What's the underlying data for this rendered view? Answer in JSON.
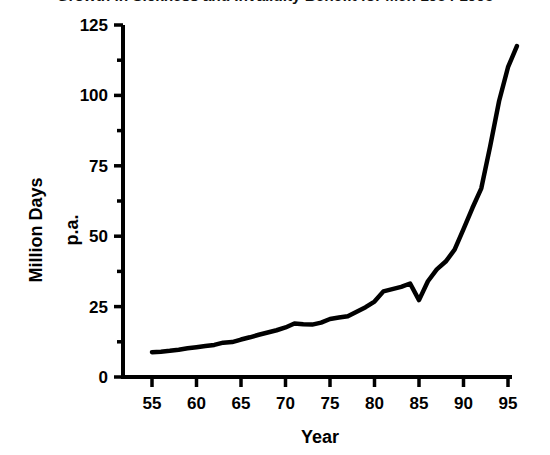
{
  "chart_data": {
    "type": "line",
    "title": "Growth in Sickness and Invalidity Benefit for Men 1954-1995",
    "xlabel": "Year",
    "ylabel_line1": "Million Days",
    "ylabel_line2": "p.a.",
    "xlim": [
      54,
      96
    ],
    "ylim": [
      0,
      125
    ],
    "xticks": [
      55,
      60,
      65,
      70,
      75,
      80,
      85,
      90,
      95
    ],
    "xtick_labels": [
      "55",
      "60",
      "65",
      "70",
      "75",
      "80",
      "85",
      "90",
      "95"
    ],
    "yticks": [
      0,
      25,
      50,
      75,
      100,
      125
    ],
    "ytick_labels": [
      "0",
      "25",
      "50",
      "75",
      "100",
      "125"
    ],
    "y_minor_ticks": [
      12.5,
      37.5,
      62.5,
      87.5,
      112.5
    ],
    "grid": false,
    "legend": "none",
    "line_color": "#000000",
    "line_width": 4.5,
    "axis_color": "#000000",
    "background_color": "#ffffff",
    "x": [
      55,
      56,
      57,
      58,
      59,
      60,
      61,
      62,
      63,
      64,
      65,
      66,
      67,
      68,
      69,
      70,
      71,
      72,
      73,
      74,
      75,
      76,
      77,
      78,
      79,
      80,
      81,
      82,
      83,
      84,
      85,
      86,
      87,
      88,
      89,
      90,
      91,
      92,
      93,
      94,
      95,
      96
    ],
    "values": [
      8.8,
      9.0,
      9.3,
      9.7,
      10.2,
      10.6,
      11.0,
      11.4,
      12.2,
      12.4,
      13.3,
      14.1,
      15.0,
      15.8,
      16.6,
      17.6,
      19.0,
      18.7,
      18.6,
      19.3,
      20.6,
      21.1,
      21.6,
      23.2,
      24.8,
      26.8,
      30.4,
      31.2,
      32.0,
      33.2,
      27.3,
      34.0,
      38.2,
      41.0,
      45.2,
      52.5,
      60.0,
      67.0,
      82.0,
      98.0,
      110.0,
      117.5
    ]
  },
  "meta": {
    "units_note": "Million Days p.a."
  }
}
